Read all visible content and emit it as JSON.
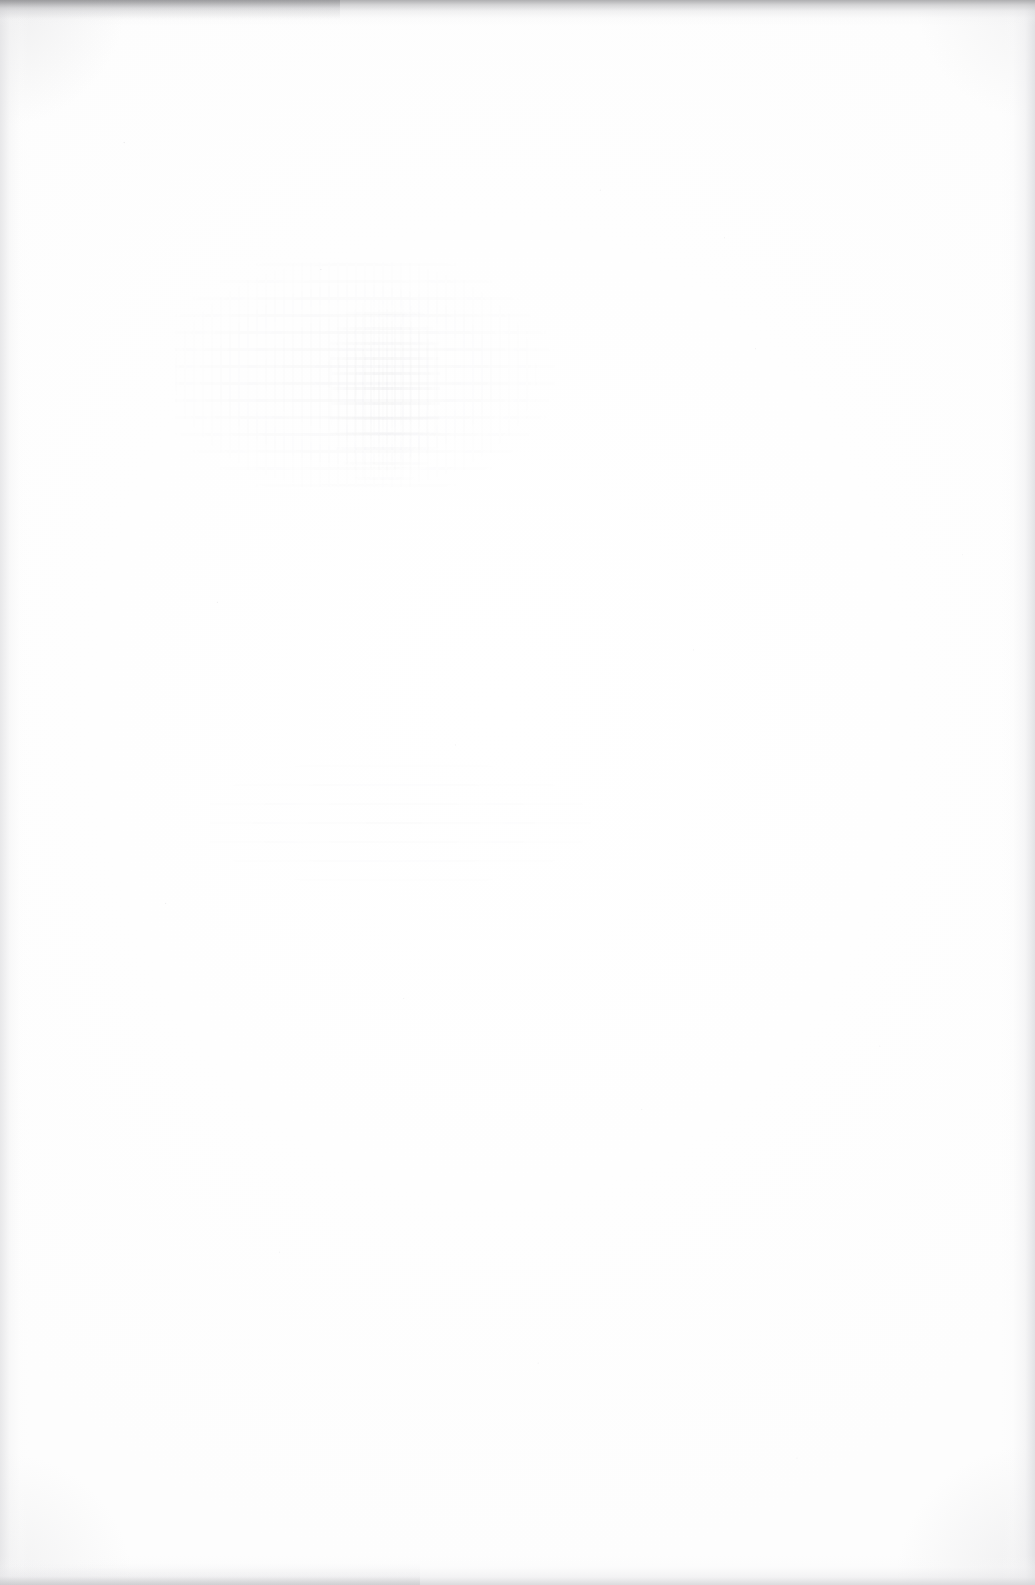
{
  "page": {
    "kind": "scanned-document-page",
    "state": "blank",
    "width_px": 1035,
    "height_px": 1585,
    "visible_text": "",
    "accessible_description": "Blank scanned page with faint bleed-through ghost marks and dark scanner edge bands"
  },
  "paper": {
    "base_color": "#ffffff",
    "tone_color": "#fdfdfd"
  },
  "edges": {
    "top": {
      "name": "top-scan-edge",
      "color": "#a8a8aa",
      "thickness_px": 26
    },
    "left": {
      "name": "left-scan-edge",
      "color": "#e4e4e6",
      "thickness_px": 30
    },
    "right": {
      "name": "right-scan-edge",
      "color": "#e0e0e3",
      "thickness_px": 34
    },
    "bottom": {
      "name": "bottom-scan-edge",
      "color": "#d6d6d9",
      "thickness_px": 30
    }
  },
  "artifacts": {
    "ghost_marks": [
      {
        "name": "bleed-through-upper-left",
        "region": "upper-left quadrant",
        "x": 175,
        "y": 262,
        "width": 400,
        "height": 225,
        "ink_color": "#60606e",
        "opacity": 0.055,
        "legible": false
      },
      {
        "name": "bleed-through-dense-column",
        "region": "upper-left, center of cluster",
        "x": 330,
        "y": 300,
        "width": 110,
        "height": 180,
        "ink_color": "#585866",
        "opacity": 0.085,
        "legible": false
      },
      {
        "name": "bleed-through-mid-left",
        "region": "mid-left",
        "x": 210,
        "y": 760,
        "width": 460,
        "height": 140,
        "ink_color": "#646470",
        "opacity": 0.03,
        "legible": false
      }
    ],
    "speckle": {
      "name": "paper-grain-speckle",
      "color": "#787882",
      "opacity": 0.3
    }
  },
  "content": {
    "body_text": "",
    "headings": [],
    "figures": [],
    "page_number": ""
  }
}
